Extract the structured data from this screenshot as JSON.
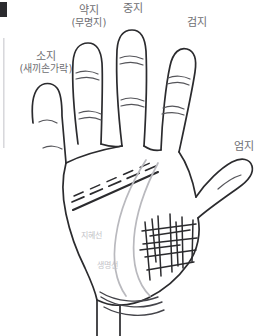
{
  "diagram": {
    "title_subject": "palm-hand-anatomy",
    "background_color": "#ffffff",
    "outline_color": "#2b2b2e",
    "label_color": "#6e6e72",
    "palm_label_color": "#c3c3c8",
    "life_line_color": "#b9b9be",
    "width": 274,
    "height": 336
  },
  "finger_labels": [
    {
      "id": "pinky",
      "main": "소지",
      "sub": "(새끼손가락)"
    },
    {
      "id": "ring",
      "main": "약지",
      "sub": "(무명지)"
    },
    {
      "id": "middle",
      "main": "중지",
      "sub": ""
    },
    {
      "id": "index",
      "main": "검지",
      "sub": "(식지)"
    },
    {
      "id": "thumb",
      "main": "엄지",
      "sub": ""
    }
  ],
  "palm_line_labels": [
    {
      "id": "head-line",
      "text": "지혜선"
    },
    {
      "id": "life-line",
      "text": "생명선"
    }
  ]
}
